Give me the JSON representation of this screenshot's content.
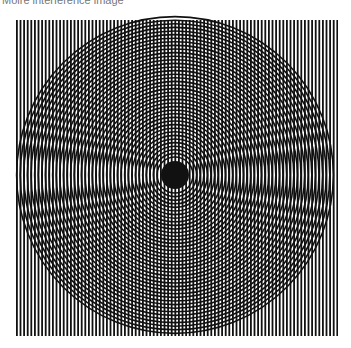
{
  "caption": "Moiré interference image",
  "figure": {
    "colors": {
      "line": "#111111",
      "background": "#ffffff"
    }
  }
}
